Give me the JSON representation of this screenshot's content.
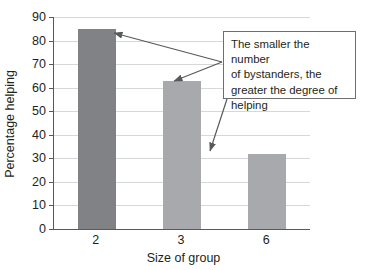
{
  "chart_data": {
    "type": "bar",
    "title": "",
    "xlabel": "Size of group",
    "ylabel": "Percentage helping",
    "categories": [
      "2",
      "3",
      "6"
    ],
    "values": [
      85,
      63,
      32
    ],
    "series": [
      {
        "name": "Percentage helping",
        "values": [
          85,
          63,
          32
        ],
        "colors": [
          "#808285",
          "#a7a9ac",
          "#a7a9ac"
        ]
      }
    ],
    "ylim": [
      0,
      90
    ],
    "ytick_labels": [
      "0",
      "10",
      "20",
      "30",
      "40",
      "50",
      "60",
      "70",
      "80",
      "90"
    ],
    "ytick_values": [
      0,
      10,
      20,
      30,
      40,
      50,
      60,
      70,
      80,
      90
    ],
    "xtick_labels": [
      "2",
      "3",
      "6"
    ],
    "grid": true,
    "grid_axis": "y",
    "legend": false,
    "annotations": [
      {
        "text": "The smaller the number of bystanders, the greater the degree of helping",
        "lines": [
          "The smaller the number",
          "of bystanders, the",
          "greater the degree of",
          "helping"
        ],
        "points_to": [
          "2",
          "3",
          "6"
        ]
      }
    ]
  },
  "colors": {
    "bar_dark": "#808285",
    "bar_light": "#a7a9ac",
    "axis": "#58595b",
    "grid": "#d6d7d9",
    "text": "#231f20",
    "annotation_border": "#6d6e71",
    "arrow": "#58595b",
    "background": "#ffffff"
  }
}
